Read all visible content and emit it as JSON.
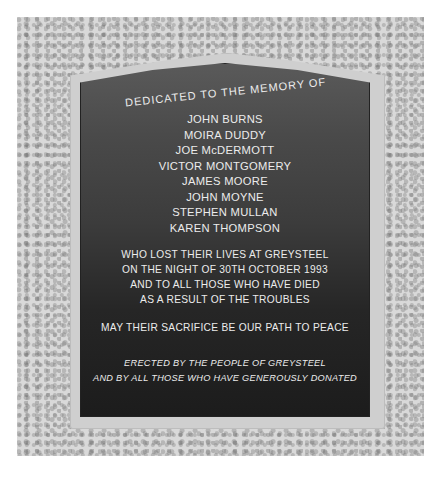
{
  "plaque": {
    "heading": "DEDICATED TO THE MEMORY OF",
    "names": [
      "JOHN BURNS",
      "MOIRA DUDDY",
      "JOE McDERMOTT",
      "VICTOR MONTGOMERY",
      "JAMES MOORE",
      "JOHN MOYNE",
      "STEPHEN MULLAN",
      "KAREN THOMPSON"
    ],
    "inscription": [
      "WHO LOST THEIR LIVES AT GREYSTEEL",
      "ON THE NIGHT OF 30TH OCTOBER 1993",
      "AND TO ALL THOSE WHO HAVE DIED",
      "AS A RESULT OF THE TROUBLES"
    ],
    "motto": "MAY THEIR SACRIFICE BE OUR PATH TO PEACE",
    "erected": [
      "ERECTED BY THE PEOPLE OF GREYSTEEL",
      "AND BY ALL THOSE WHO HAVE GENEROUSLY DONATED"
    ]
  },
  "colors": {
    "plaque_dark": "#262626",
    "plaque_top": "#5a5a5a",
    "stone": "#cfcfcf",
    "wall": "#d9d9d9",
    "lettering": "#ececec"
  }
}
